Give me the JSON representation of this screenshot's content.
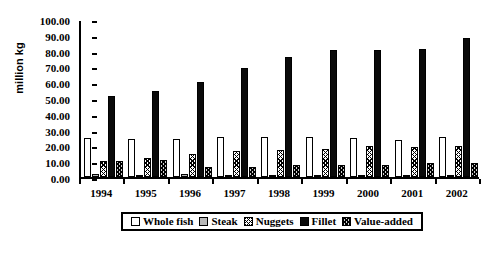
{
  "chart_data": {
    "type": "bar",
    "title": "",
    "xlabel": "",
    "ylabel": "million kg",
    "ylim": [
      0,
      100
    ],
    "ytick_step": 10,
    "ytick_labels": [
      "100.00",
      "90.00",
      "80.00",
      "70.00",
      "60.00",
      "50.00",
      "40.00",
      "30.00",
      "20.00",
      "10.00",
      "0.00"
    ],
    "grid": false,
    "legend_position": "bottom",
    "categories": [
      "1994",
      "1995",
      "1996",
      "1997",
      "1998",
      "1999",
      "2000",
      "2001",
      "2002"
    ],
    "series": [
      {
        "name": "Whole fish",
        "key": "whole-fish",
        "color": "#ffffff",
        "pattern": "solid-white",
        "values": [
          25.0,
          24.2,
          24.2,
          25.3,
          25.4,
          25.6,
          24.9,
          23.5,
          25.6
        ]
      },
      {
        "name": "Steak",
        "key": "steak",
        "color": "#b8b8b8",
        "pattern": "solid-gray",
        "values": [
          2.0,
          1.2,
          1.6,
          1.3,
          1.3,
          1.0,
          1.0,
          1.0,
          1.1
        ]
      },
      {
        "name": "Nuggets",
        "key": "nuggets",
        "color": "#ffffff",
        "pattern": "crosshatch-light",
        "values": [
          10.4,
          12.1,
          14.6,
          16.4,
          17.4,
          17.8,
          19.6,
          19.1,
          19.5
        ]
      },
      {
        "name": "Fillet",
        "key": "fillet",
        "color": "#0a0a0a",
        "pattern": "solid-black",
        "values": [
          51.3,
          54.6,
          60.4,
          69.0,
          76.0,
          80.3,
          80.6,
          81.0,
          88.2
        ]
      },
      {
        "name": "Value-added",
        "key": "value-added",
        "color": "#d0d0d0",
        "pattern": "crosshatch-dark",
        "values": [
          10.3,
          10.8,
          6.6,
          6.6,
          7.5,
          7.6,
          7.9,
          8.7,
          8.6
        ]
      }
    ]
  }
}
